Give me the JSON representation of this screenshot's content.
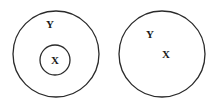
{
  "diagrams": [
    {
      "name": "nested-sets",
      "description": "X is a subset inside Y",
      "outer_label": "Y",
      "inner_label": "X",
      "has_inner_circle": true
    },
    {
      "name": "same-set",
      "description": "X and Y share one circle",
      "outer_label": "Y",
      "inner_label": "X",
      "has_inner_circle": false
    }
  ],
  "colors": {
    "stroke": "#2a2a2a",
    "text": "#1a1a1a",
    "background": "#ffffff"
  }
}
